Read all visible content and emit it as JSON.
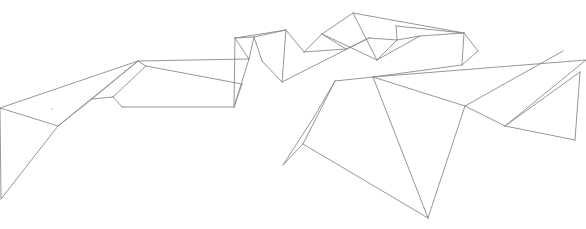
{
  "figure": {
    "stroke_color": "#8a8a8a",
    "background": "#ffffff"
  },
  "vertices": {
    "A": [
      0,
      108
    ],
    "B": [
      1,
      199
    ],
    "C": [
      138,
      61
    ],
    "D": [
      58,
      126
    ],
    "E": [
      92,
      99
    ],
    "F": [
      113,
      97
    ],
    "G": [
      122,
      107
    ],
    "H": [
      146,
      66
    ],
    "I": [
      234,
      107
    ],
    "J": [
      242,
      84
    ],
    "K": [
      254,
      37
    ],
    "L": [
      235,
      38
    ],
    "M": [
      286,
      30
    ],
    "N": [
      249,
      59
    ],
    "O": [
      262,
      61
    ],
    "P": [
      282,
      82
    ],
    "Q": [
      304,
      52
    ],
    "R": [
      322,
      34
    ],
    "S": [
      353,
      13
    ],
    "T": [
      369,
      38
    ],
    "U": [
      346,
      49
    ],
    "V": [
      377,
      60
    ],
    "W": [
      397,
      40
    ],
    "X": [
      420,
      36
    ],
    "Y": [
      396,
      26
    ],
    "Z": [
      464,
      33
    ],
    "AA": [
      478,
      51
    ],
    "AB": [
      462,
      65
    ],
    "AC": [
      283,
      165
    ],
    "AD": [
      314,
      117
    ],
    "AE": [
      335,
      81
    ],
    "AF": [
      303,
      144
    ],
    "AG": [
      373,
      77
    ],
    "AH": [
      428,
      218
    ],
    "AI": [
      465,
      106
    ],
    "AJ": [
      505,
      126
    ],
    "AK": [
      586,
      60
    ],
    "AL": [
      580,
      72
    ],
    "AM": [
      575,
      140
    ],
    "AN": [
      563,
      51
    ]
  },
  "edges": [
    [
      "A",
      "B"
    ],
    [
      "A",
      "C"
    ],
    [
      "A",
      "D"
    ],
    [
      "B",
      "D"
    ],
    [
      "D",
      "C"
    ],
    [
      "D",
      "E"
    ],
    [
      "E",
      "F"
    ],
    [
      "F",
      "H"
    ],
    [
      "E",
      "C"
    ],
    [
      "F",
      "G"
    ],
    [
      "G",
      "I"
    ],
    [
      "C",
      "H"
    ],
    [
      "C",
      "N"
    ],
    [
      "H",
      "J"
    ],
    [
      "N",
      "I"
    ],
    [
      "N",
      "L"
    ],
    [
      "L",
      "I"
    ],
    [
      "J",
      "I"
    ],
    [
      "N",
      "K"
    ],
    [
      "L",
      "K"
    ],
    [
      "K",
      "M"
    ],
    [
      "L",
      "M"
    ],
    [
      "K",
      "O"
    ],
    [
      "O",
      "P"
    ],
    [
      "M",
      "P"
    ],
    [
      "M",
      "Q"
    ],
    [
      "P",
      "T"
    ],
    [
      "Q",
      "R"
    ],
    [
      "R",
      "S"
    ],
    [
      "R",
      "V"
    ],
    [
      "S",
      "V"
    ],
    [
      "S",
      "Z"
    ],
    [
      "Q",
      "U"
    ],
    [
      "U",
      "T"
    ],
    [
      "U",
      "R"
    ],
    [
      "T",
      "W"
    ],
    [
      "V",
      "W"
    ],
    [
      "V",
      "X"
    ],
    [
      "W",
      "X"
    ],
    [
      "X",
      "Z"
    ],
    [
      "Z",
      "AA"
    ],
    [
      "Z",
      "AB"
    ],
    [
      "AA",
      "AB"
    ],
    [
      "W",
      "Y"
    ],
    [
      "Y",
      "Z"
    ],
    [
      "AB",
      "AG"
    ],
    [
      "AC",
      "AD"
    ],
    [
      "AD",
      "AE"
    ],
    [
      "AE",
      "AG"
    ],
    [
      "AC",
      "AF"
    ],
    [
      "AF",
      "AE"
    ],
    [
      "AF",
      "AH"
    ],
    [
      "AG",
      "AH"
    ],
    [
      "AG",
      "AI"
    ],
    [
      "AI",
      "AH"
    ],
    [
      "AI",
      "AJ"
    ],
    [
      "AI",
      "AN"
    ],
    [
      "AG",
      "AK"
    ],
    [
      "AJ",
      "AL"
    ],
    [
      "AJ",
      "AK"
    ],
    [
      "AJ",
      "AM"
    ],
    [
      "AM",
      "AL"
    ]
  ]
}
